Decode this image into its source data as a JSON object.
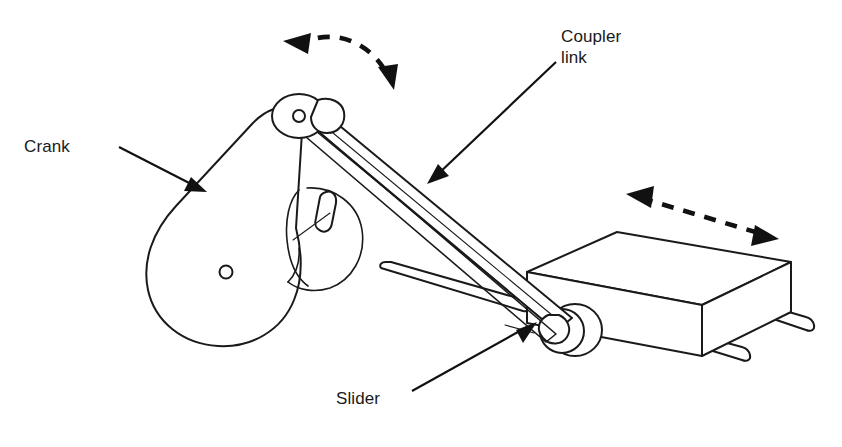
{
  "diagram": {
    "type": "engineering-line-drawing",
    "background_color": "#ffffff",
    "line_color": "#1a1a1a",
    "width": 842,
    "height": 447
  },
  "labels": {
    "crank": "Crank",
    "coupler_line1": "Coupler",
    "coupler_line2": "link",
    "slider": "Slider"
  },
  "parts": [
    {
      "name": "crank",
      "label": "Crank",
      "shape": "teardrop-plate",
      "description": "Pear/teardrop shaped rotating plate with center bore and crank pin at narrow end",
      "pivot_hole": {
        "x": 226,
        "y": 272,
        "r": 6
      }
    },
    {
      "name": "crank-hub",
      "label": "",
      "shape": "cylinder",
      "description": "Cylindrical bearing hub behind the crank plate with key feature"
    },
    {
      "name": "coupler-link",
      "label": "Coupler link",
      "shape": "two-parallel-bars",
      "description": "Slender connecting rod running from crank pin down-right to slider pin"
    },
    {
      "name": "slider",
      "label": "Slider",
      "shape": "isometric-box",
      "description": "Rectangular block riding on two parallel guide rods, with pivot boss on left face"
    },
    {
      "name": "guide-rods",
      "label": "",
      "shape": "two-cylinders",
      "description": "Two parallel cylindrical rails passing through the slider block"
    }
  ],
  "motion_arrows": [
    {
      "name": "crank-rotation-arrow",
      "style": "curved-dashed-double-headed",
      "meaning": "rotation of the crank",
      "position": "above crank pin"
    },
    {
      "name": "slider-translation-arrow",
      "style": "straight-dashed-double-headed",
      "meaning": "reciprocating translation of the slider",
      "position": "above slider block, sloping down-right"
    }
  ],
  "leader_lines": [
    {
      "name": "crank-leader",
      "from_label": "Crank",
      "points_to": "crank plate upper-left edge"
    },
    {
      "name": "coupler-leader",
      "from_label": "Coupler link",
      "points_to": "coupler link mid-span"
    },
    {
      "name": "slider-leader",
      "from_label": "Slider",
      "points_to": "slider block lower-left corner"
    }
  ]
}
